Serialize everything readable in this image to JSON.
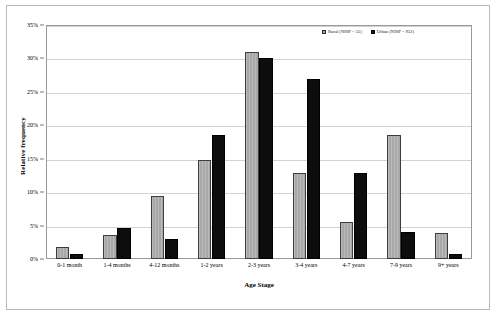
{
  "chart_data": {
    "type": "bar",
    "title": "",
    "xlabel": "Age Stage",
    "ylabel": "Relative frequency",
    "ylim": [
      0,
      35
    ],
    "ytick_labels": [
      "0%",
      "5%",
      "10%",
      "15%",
      "20%",
      "25%",
      "30%",
      "35%"
    ],
    "ytick_values": [
      0,
      5,
      10,
      15,
      20,
      25,
      30,
      35
    ],
    "grid": true,
    "legend_position": "top-right",
    "categories": [
      "0-1 month",
      "1-4 months",
      "4-12 months",
      "1-2 years",
      "2-3 years",
      "3-4 years",
      "4-7 years",
      "7-9 years",
      "9+ years"
    ],
    "series": [
      {
        "name": "Rural (NISP = 55)",
        "color": "#a8a8a8",
        "values": [
          1.8,
          3.6,
          9.4,
          14.8,
          31.0,
          12.9,
          5.6,
          18.5,
          3.9
        ]
      },
      {
        "name": "Urban (NISP = 952)",
        "color": "#0d0d0d",
        "values": [
          0.7,
          4.7,
          3.0,
          18.5,
          30.0,
          27.0,
          12.8,
          4.0,
          0.7
        ]
      }
    ]
  }
}
